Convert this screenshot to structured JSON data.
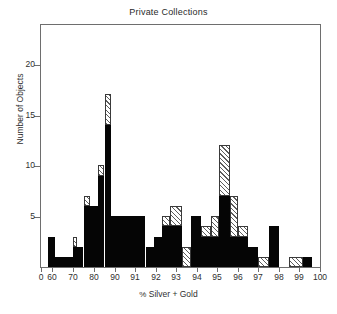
{
  "chart_data": {
    "type": "bar",
    "title": "Private Collections",
    "xlabel": "% Silver + Gold",
    "ylabel": "Number of Objects",
    "grid": false,
    "legend_position": "none",
    "ylim": [
      0,
      24
    ],
    "y_ticks": [
      5,
      10,
      15,
      20
    ],
    "x_axis_note": "Broken / non-linear axis: 60-90 compressed (10-unit ticks), 90-100 expanded (1-unit ticks)",
    "x_ticks": [
      {
        "label": "0",
        "value": 0,
        "px": 41
      },
      {
        "label": "60",
        "value": 60,
        "px": 52
      },
      {
        "label": "70",
        "value": 70,
        "px": 73
      },
      {
        "label": "80",
        "value": 80,
        "px": 94
      },
      {
        "label": "90",
        "value": 90,
        "px": 115
      },
      {
        "label": "91",
        "value": 91,
        "px": 135
      },
      {
        "label": "92",
        "value": 92,
        "px": 156
      },
      {
        "label": "93",
        "value": 93,
        "px": 176
      },
      {
        "label": "94",
        "value": 94,
        "px": 197
      },
      {
        "label": "95",
        "value": 95,
        "px": 217
      },
      {
        "label": "96",
        "value": 96,
        "px": 238
      },
      {
        "label": "97",
        "value": 97,
        "px": 258
      },
      {
        "label": "98",
        "value": 98,
        "px": 279
      },
      {
        "label": "99",
        "value": 99,
        "px": 299
      },
      {
        "label": "100",
        "value": 100,
        "px": 320
      }
    ],
    "series": [
      {
        "name": "black",
        "fill": "solid-black",
        "color": "#050505"
      },
      {
        "name": "hatched",
        "fill": "diagonal-hatch",
        "color": "#5d5d5d"
      }
    ],
    "bins": [
      {
        "x0": 58.0,
        "x1": 61.5,
        "black": 3,
        "hatched": 0
      },
      {
        "x0": 61.5,
        "x1": 70.0,
        "black": 1,
        "hatched": 0
      },
      {
        "x0": 70.0,
        "x1": 71.7,
        "black": 2,
        "hatched": 1
      },
      {
        "x0": 71.7,
        "x1": 75.0,
        "black": 2,
        "hatched": 0
      },
      {
        "x0": 75.0,
        "x1": 78.3,
        "black": 6,
        "hatched": 1
      },
      {
        "x0": 78.3,
        "x1": 81.7,
        "black": 6,
        "hatched": 0
      },
      {
        "x0": 81.7,
        "x1": 85.0,
        "black": 9,
        "hatched": 1
      },
      {
        "x0": 85.0,
        "x1": 88.3,
        "black": 14,
        "hatched": 3
      },
      {
        "x0": 88.3,
        "x1": 91.5,
        "black": 5,
        "hatched": 0
      },
      {
        "x0": 91.5,
        "x1": 91.9,
        "black": 2,
        "hatched": 0
      },
      {
        "x0": 91.9,
        "x1": 92.3,
        "black": 3,
        "hatched": 0
      },
      {
        "x0": 92.3,
        "x1": 92.7,
        "black": 4,
        "hatched": 1
      },
      {
        "x0": 92.7,
        "x1": 93.3,
        "black": 4,
        "hatched": 2
      },
      {
        "x0": 93.3,
        "x1": 93.7,
        "black": 0,
        "hatched": 2
      },
      {
        "x0": 93.7,
        "x1": 94.2,
        "black": 5,
        "hatched": 0
      },
      {
        "x0": 94.2,
        "x1": 94.7,
        "black": 3,
        "hatched": 1
      },
      {
        "x0": 94.7,
        "x1": 95.1,
        "black": 3,
        "hatched": 2
      },
      {
        "x0": 95.1,
        "x1": 95.6,
        "black": 7,
        "hatched": 5
      },
      {
        "x0": 95.6,
        "x1": 96.0,
        "black": 3,
        "hatched": 4
      },
      {
        "x0": 96.0,
        "x1": 96.5,
        "black": 3,
        "hatched": 1
      },
      {
        "x0": 96.5,
        "x1": 97.0,
        "black": 2,
        "hatched": 0
      },
      {
        "x0": 97.0,
        "x1": 97.5,
        "black": 0,
        "hatched": 1
      },
      {
        "x0": 97.5,
        "x1": 98.0,
        "black": 4,
        "hatched": 0
      },
      {
        "x0": 98.5,
        "x1": 99.2,
        "black": 0,
        "hatched": 1
      },
      {
        "x0": 99.2,
        "x1": 99.6,
        "black": 1,
        "hatched": 0
      }
    ]
  }
}
